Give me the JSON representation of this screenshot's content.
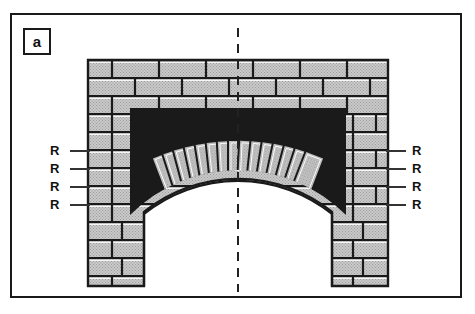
{
  "figure": {
    "panel_label": "a",
    "title_hidden": "",
    "border_color": "#1a1a1a",
    "background": "#ffffff",
    "width": 475,
    "height": 314
  },
  "annotations": {
    "left_labels": [
      {
        "text": "R",
        "x": 52,
        "y": 145,
        "leader_x1": 70,
        "leader_x2": 90,
        "leader_y": 151
      },
      {
        "text": "R",
        "x": 52,
        "y": 163,
        "leader_x1": 70,
        "leader_x2": 90,
        "leader_y": 169
      },
      {
        "text": "R",
        "x": 52,
        "y": 181,
        "leader_x1": 70,
        "leader_x2": 90,
        "leader_y": 187
      },
      {
        "text": "R",
        "x": 52,
        "y": 199,
        "leader_x1": 70,
        "leader_x2": 90,
        "leader_y": 205
      }
    ],
    "right_labels": [
      {
        "text": "R",
        "x": 410,
        "y": 145,
        "leader_x1": 385,
        "leader_x2": 405,
        "leader_y": 151
      },
      {
        "text": "R",
        "x": 410,
        "y": 163,
        "leader_x1": 385,
        "leader_x2": 405,
        "leader_y": 169
      },
      {
        "text": "R",
        "x": 410,
        "y": 181,
        "leader_x1": 385,
        "leader_x2": 405,
        "leader_y": 187
      },
      {
        "text": "R",
        "x": 410,
        "y": 199,
        "leader_x1": 385,
        "leader_x2": 405,
        "leader_y": 205
      }
    ],
    "centerline": {
      "x": 238,
      "y_top": 28,
      "y_bottom": 292,
      "style": "dashed",
      "color": "#222222"
    }
  },
  "masonry": {
    "fill_color": "#c9c9c9",
    "mortar_color": "#1a1a1a",
    "stipple_color": "#9a9a9a",
    "wall": {
      "x": 88,
      "y": 60,
      "width": 300,
      "height": 226,
      "course_height": 18,
      "brick_unit_width": 47
    },
    "arch": {
      "type": "segmental",
      "center_x": 238,
      "springing_left_x": 140,
      "springing_right_x": 336,
      "crown_y": 186,
      "springing_y": 212,
      "voussoir_rings": 2,
      "voussoir_count": 15,
      "extrados_y": 112
    },
    "piers": {
      "left": {
        "x": 88,
        "y": 200,
        "width": 56,
        "height": 86
      },
      "right": {
        "x": 332,
        "y": 200,
        "width": 56,
        "height": 86
      }
    },
    "opening": {
      "left_x": 144,
      "right_x": 332,
      "top_y": 186,
      "bottom_y": 286
    }
  }
}
